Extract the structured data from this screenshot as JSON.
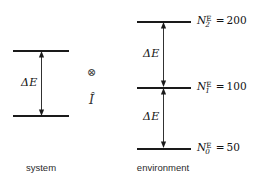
{
  "figure": {
    "background_color": "#ffffff",
    "level_color": "#1a1a1a",
    "text_color": "#111111"
  },
  "system": {
    "caption": "system",
    "gap_label": "ΔE",
    "levels": [
      {
        "id": "system-upper",
        "y": 50
      },
      {
        "id": "system-lower",
        "y": 115
      }
    ]
  },
  "operators": {
    "tensor_product": "⊗",
    "identity": "Î"
  },
  "environment": {
    "caption": "environment",
    "gap_labels": [
      "ΔE",
      "ΔE"
    ],
    "levels": [
      {
        "id": "env-level-2",
        "symbol": "N",
        "subscript": "2",
        "superscript": "E",
        "equals": "=",
        "value": "200",
        "y": 21
      },
      {
        "id": "env-level-1",
        "symbol": "N",
        "subscript": "1",
        "superscript": "E",
        "equals": "=",
        "value": "100",
        "y": 87
      },
      {
        "id": "env-level-0",
        "symbol": "N",
        "subscript": "0",
        "superscript": "E",
        "equals": "=",
        "value": "50",
        "y": 148
      }
    ]
  }
}
